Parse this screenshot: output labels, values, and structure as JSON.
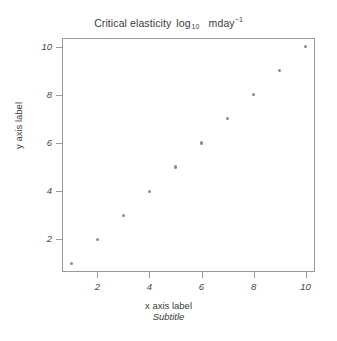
{
  "chart_data": {
    "type": "scatter",
    "title_parts": {
      "main": "Critical elasticity",
      "log": "log",
      "log_base": "10",
      "unit": "mday",
      "unit_exponent": "−1"
    },
    "subtitle": "Subtitle",
    "xlabel": "x axis label",
    "ylabel": "y axis label",
    "x": [
      1,
      2,
      3,
      4,
      5,
      6,
      7,
      8,
      9,
      10
    ],
    "y": [
      1,
      2,
      3,
      4,
      5,
      6,
      7,
      8,
      9,
      10
    ],
    "series": [
      {
        "name": "points",
        "x": [
          1,
          2,
          3,
          4,
          5,
          6,
          7,
          8,
          9,
          10
        ],
        "y": [
          1,
          2,
          3,
          4,
          5,
          6,
          7,
          8,
          9,
          10
        ]
      }
    ],
    "xlim": [
      0.64,
      10.36
    ],
    "ylim": [
      0.64,
      10.36
    ],
    "xticks": [
      2,
      4,
      6,
      8,
      10
    ],
    "yticks": [
      2,
      4,
      6,
      8,
      10
    ],
    "xtick_labels": [
      "2",
      "4",
      "6",
      "8",
      "10"
    ],
    "ytick_labels": [
      "2",
      "4",
      "6",
      "8",
      "10"
    ],
    "grid": false,
    "legend": null,
    "point_color": "#8c8c8c",
    "axis_color": "#9a9a9a",
    "text_color": "#3a3a3a",
    "background": "#ffffff"
  }
}
